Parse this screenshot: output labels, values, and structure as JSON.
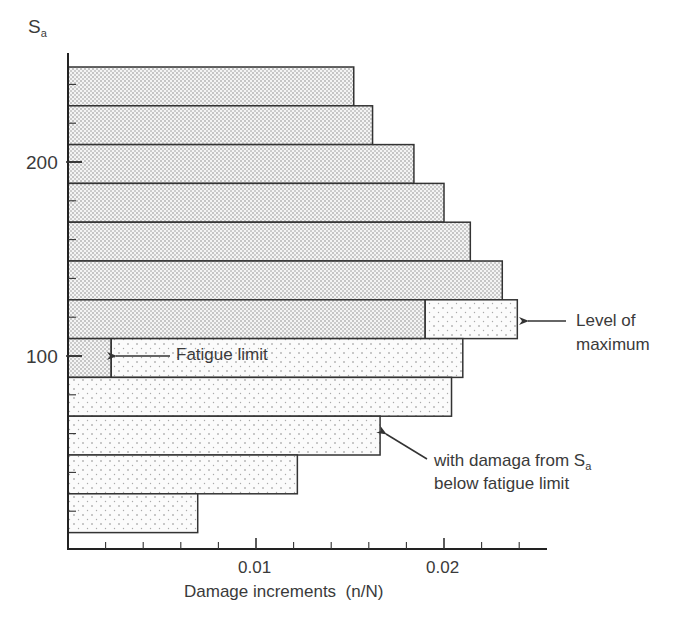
{
  "chart_data": {
    "type": "bar",
    "orientation": "horizontal",
    "title": "",
    "ylabel": "Sa",
    "xlabel": "Damage increments  (n/N)",
    "xlim": [
      0,
      0.0255
    ],
    "ylim": [
      10,
      250
    ],
    "x_major_ticks": [
      0.01,
      0.02
    ],
    "x_minor_tick_step": 0.002,
    "y_tick_labels": [
      {
        "value": 200,
        "label": "200"
      },
      {
        "value": 100,
        "label": "100"
      }
    ],
    "y_minor_tick_step": 20,
    "grid": false,
    "legend": null,
    "categories": [
      240,
      220,
      200,
      180,
      160,
      140,
      120,
      100,
      80,
      60,
      40,
      20
    ],
    "series": [
      {
        "name": "Damage (dense pattern)",
        "pattern": "dense",
        "values": [
          0.0152,
          0.0162,
          0.0184,
          0.02,
          0.0214,
          0.0231,
          0.019,
          0.0023,
          0,
          0,
          0,
          0
        ]
      },
      {
        "name": "Damage from Sa below fatigue limit (sparse pattern)",
        "pattern": "sparse",
        "values": [
          0,
          0,
          0,
          0,
          0,
          0,
          0.0049,
          0.0187,
          0.0204,
          0.0166,
          0.0122,
          0.0069
        ]
      }
    ],
    "totals": [
      0.0152,
      0.0162,
      0.0184,
      0.02,
      0.0214,
      0.0231,
      0.0239,
      0.021,
      0.0204,
      0.0166,
      0.0122,
      0.0069
    ],
    "annotations": [
      {
        "text": "Fatigue limit",
        "arrow_to": {
          "x": 0.0023,
          "y": 100
        }
      },
      {
        "text": "Level of maximum",
        "lines": [
          "Level of",
          "maximum"
        ],
        "arrow_to": {
          "x": 0.0239,
          "y": 120
        }
      },
      {
        "text": "with damaga from Sa below fatigue limit",
        "lines": [
          "with damaga from S",
          "below fatigue limit"
        ],
        "arrow_to": {
          "x": 0.0166,
          "y": 60
        }
      }
    ]
  },
  "labels": {
    "y_axis_main": "S",
    "y_axis_sub": "a",
    "y200": "200",
    "y100": "100",
    "x001": "0.01",
    "x002": "0.02",
    "x_title": "Damage increments  (n/N)",
    "fatigue": "Fatigue limit",
    "lom1": "Level of",
    "lom2": "maximum",
    "wd1_main": "with damaga from S",
    "wd1_sub": "a",
    "wd2": "below fatigue limit"
  }
}
